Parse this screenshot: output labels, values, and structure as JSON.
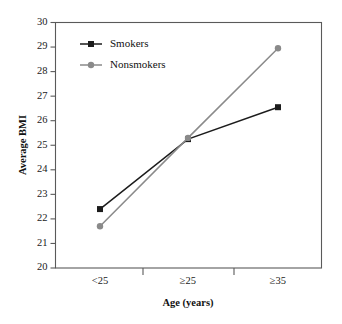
{
  "chart_data": {
    "type": "line",
    "title": "",
    "xlabel": "Age (years)",
    "ylabel": "Average BMI",
    "categories": [
      "<25",
      "≥25",
      "≥35"
    ],
    "series": [
      {
        "name": "Smokers",
        "values": [
          22.4,
          25.25,
          26.55
        ],
        "color": "#1c1c1c",
        "marker": "square"
      },
      {
        "name": "Nonsmokers",
        "values": [
          21.7,
          25.3,
          28.95
        ],
        "color": "#8a8a8a",
        "marker": "circle"
      }
    ],
    "ylim": [
      20,
      30
    ],
    "yticks": [
      20,
      21,
      22,
      23,
      24,
      25,
      26,
      27,
      28,
      29,
      30
    ],
    "ytick_labels": [
      "20",
      "21",
      "22",
      "23",
      "24",
      "25",
      "26",
      "27",
      "28",
      "29",
      "30"
    ],
    "grid": false,
    "legend_position": "upper-left-inside",
    "frame": "box"
  },
  "legend": {
    "entries": [
      {
        "label": "Smokers"
      },
      {
        "label": "Nonsmokers"
      }
    ]
  },
  "axes": {
    "y_title": "Average BMI",
    "x_title": "Age (years)"
  }
}
